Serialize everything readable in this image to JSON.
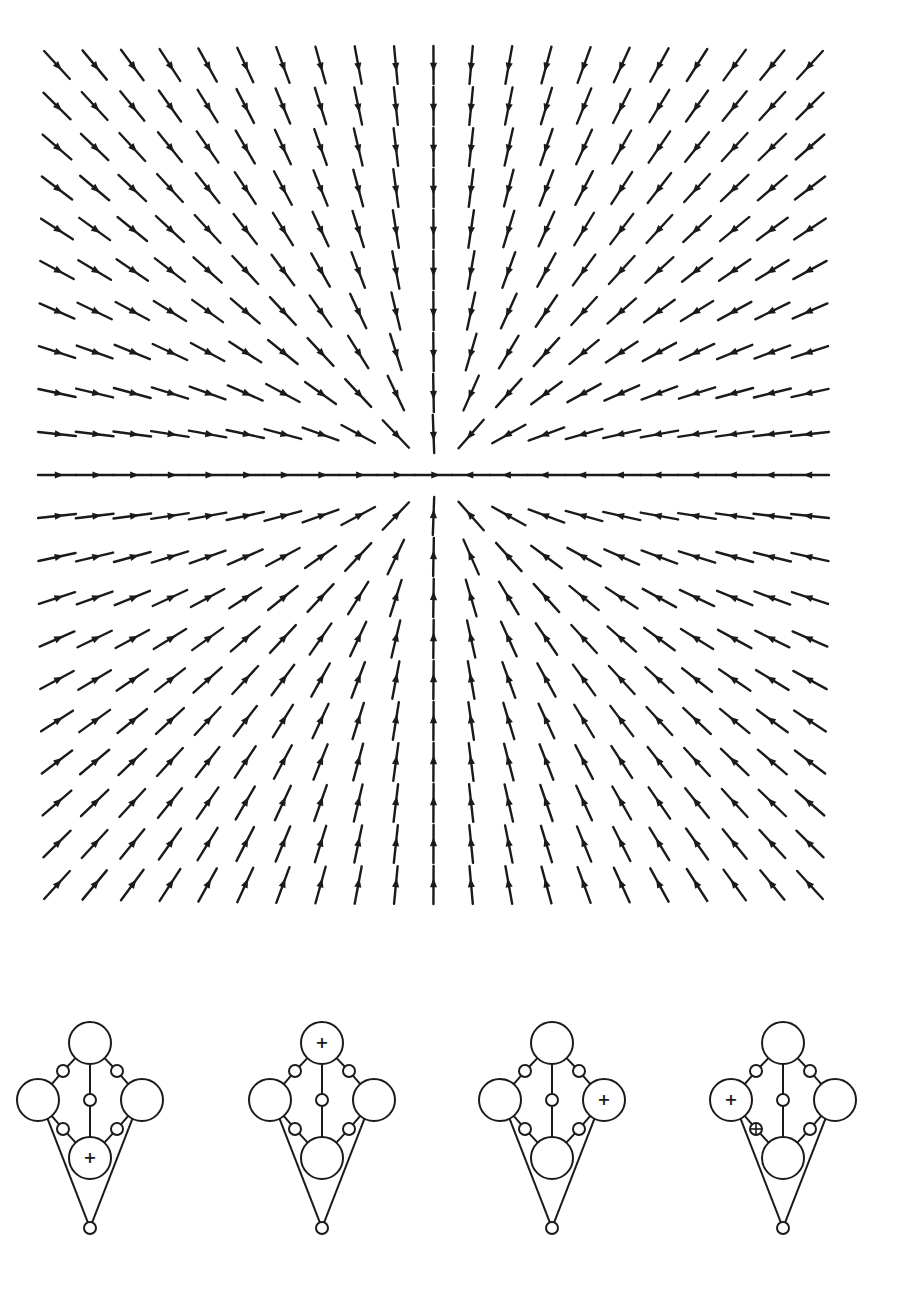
{
  "figure": {
    "ink_color": "#1a1a1a",
    "background": "#ffffff"
  },
  "vector_field": {
    "type": "sink",
    "center": [
      435,
      475
    ],
    "x_start": 57,
    "x_end": 810,
    "y_start": 65,
    "y_end": 885,
    "columns": 21,
    "rows": 21,
    "arrow_length": 38,
    "arrowhead_position": 0.68,
    "stroke_width": 2.4
  },
  "diagrams": {
    "node_layout": {
      "top": {
        "dx": 0,
        "dy": -57,
        "r": 21
      },
      "left": {
        "dx": -52,
        "dy": 0,
        "r": 21
      },
      "right": {
        "dx": 52,
        "dy": 0,
        "r": 21
      },
      "bottom": {
        "dx": 0,
        "dy": 58,
        "r": 21
      },
      "upper_left": {
        "dx": -27,
        "dy": -29,
        "r": 6
      },
      "upper_right": {
        "dx": 27,
        "dy": -29,
        "r": 6
      },
      "center": {
        "dx": 0,
        "dy": 0,
        "r": 6
      },
      "lower_left": {
        "dx": -27,
        "dy": 29,
        "r": 6
      },
      "lower_right": {
        "dx": 27,
        "dy": 29,
        "r": 6
      },
      "apex": {
        "dx": 0,
        "dy": 128,
        "r": 6
      }
    },
    "center_y": 1100,
    "items": [
      {
        "label": "state-1",
        "cx": 90,
        "plus_node": "bottom",
        "crossed_node": null
      },
      {
        "label": "state-2",
        "cx": 322,
        "plus_node": "top",
        "crossed_node": null
      },
      {
        "label": "state-3",
        "cx": 552,
        "plus_node": "right",
        "crossed_node": null
      },
      {
        "label": "state-4",
        "cx": 783,
        "plus_node": "left",
        "crossed_node": "lower_left"
      }
    ],
    "plus_symbol": "+"
  }
}
